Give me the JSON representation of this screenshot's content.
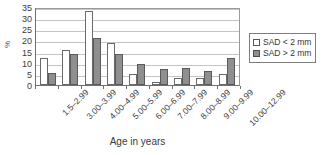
{
  "chart_data": {
    "type": "bar",
    "title": "",
    "xlabel": "Age in years",
    "ylabel": "%",
    "ylim": [
      0,
      35
    ],
    "ytick_step": 5,
    "yticks": [
      35,
      30,
      25,
      20,
      15,
      10,
      5,
      0
    ],
    "grid": true,
    "legend_position": "right",
    "categories": [
      "1.5–2.99",
      "3.00–3.99",
      "4.00–4.99",
      "5.00–5.99",
      "6.00–6.99",
      "7.00–7.99",
      "8.00–8.99",
      "9.00–9.99",
      "10.00–12.99"
    ],
    "series": [
      {
        "name": "SAD < 2 mm",
        "color": "#ffffff",
        "values": [
          12.3,
          15.5,
          33.0,
          19.0,
          5.0,
          1.5,
          3.0,
          3.0,
          5.0
        ]
      },
      {
        "name": "SAD > 2 mm",
        "color": "#8f8f8f",
        "values": [
          5.5,
          13.8,
          21.0,
          13.8,
          9.5,
          7.0,
          7.8,
          6.5,
          12.0
        ]
      }
    ]
  },
  "legend": {
    "entries": [
      {
        "label": "SAD < 2 mm"
      },
      {
        "label": "SAD > 2 mm"
      }
    ]
  },
  "axes": {
    "y_title": "%",
    "x_title": "Age in years"
  }
}
